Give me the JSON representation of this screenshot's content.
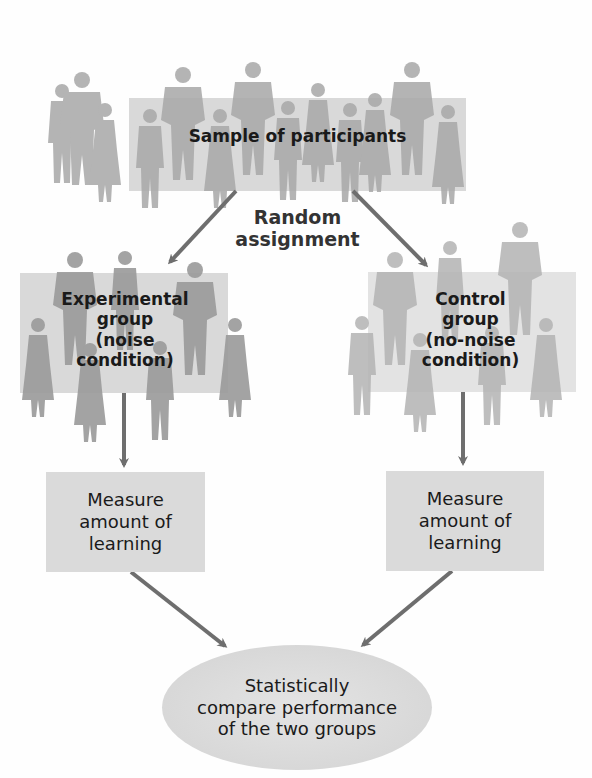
{
  "diagram": {
    "sample": {
      "label": "Sample of participants"
    },
    "assignment": {
      "line1": "Random",
      "line2": "assignment"
    },
    "experimental_group": {
      "lines": [
        "Experimental",
        "group",
        "(noise",
        "condition)"
      ]
    },
    "control_group": {
      "lines": [
        "Control",
        "group",
        "(no-noise",
        "condition)"
      ]
    },
    "measure_left": {
      "lines": [
        "Measure",
        "amount of",
        "learning"
      ]
    },
    "measure_right": {
      "lines": [
        "Measure",
        "amount of",
        "learning"
      ]
    },
    "compare": {
      "lines": [
        "Statistically",
        "compare performance",
        "of the two groups"
      ]
    },
    "colors": {
      "arrow": "#6e6e6e",
      "box": "#dadada",
      "silhouette": "#a9a9a9",
      "text": "#1a1a1a"
    }
  }
}
